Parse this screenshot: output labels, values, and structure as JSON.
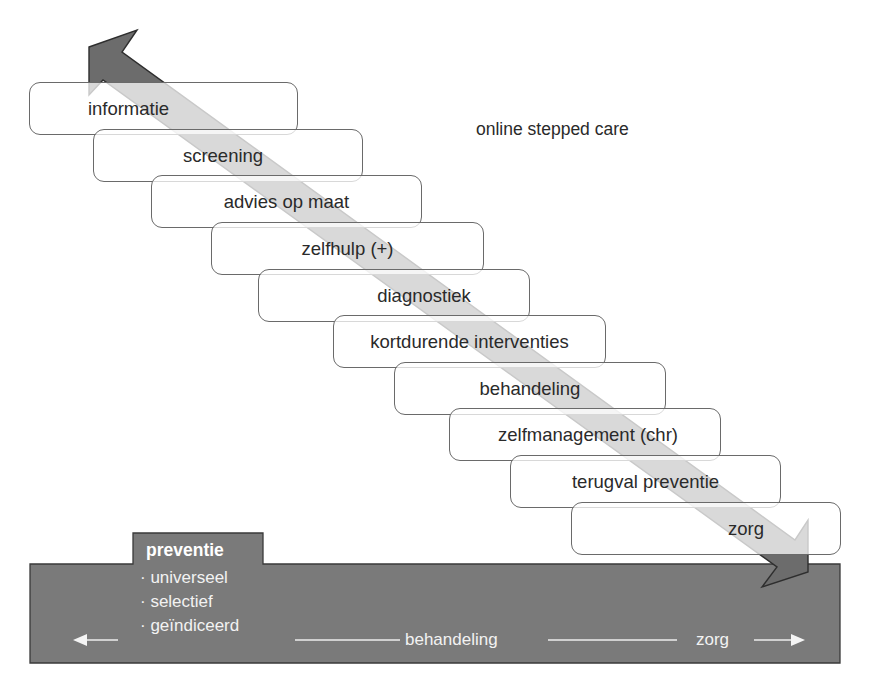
{
  "diagram": {
    "title": "online stepped care",
    "steps": [
      {
        "label": "informatie"
      },
      {
        "label": "screening"
      },
      {
        "label": "advies op maat"
      },
      {
        "label": "zelfhulp (+)"
      },
      {
        "label": "diagnostiek"
      },
      {
        "label": "kortdurende interventies"
      },
      {
        "label": "behandeling"
      },
      {
        "label": "zelfmanagement (chr)"
      },
      {
        "label": "terugval preventie"
      },
      {
        "label": "zorg"
      }
    ],
    "arrow": {
      "type": "double-headed-diagonal",
      "direction": "top-left to bottom-right"
    },
    "base": {
      "tab_label": "preventie",
      "prevention_types": [
        "· universeel",
        "· selectief",
        "· geïndiceerd"
      ],
      "axis_labels": {
        "middle": "behandeling",
        "right": "zorg"
      },
      "colors": {
        "band": "#7a7a7a",
        "arrow": "#6c6c6c",
        "text": "#ffffff"
      }
    }
  }
}
